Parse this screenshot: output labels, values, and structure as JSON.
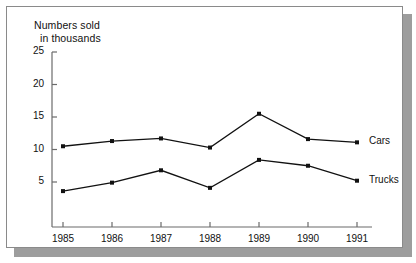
{
  "figure": {
    "axis_title_line1": "Numbers sold",
    "axis_title_line2": "in thousands",
    "border_color": "#8a8a8a",
    "shadow_color": "#9d9d9d",
    "ink_color": "#111111"
  },
  "chart_data": {
    "type": "line",
    "title": "",
    "subtitle": "",
    "xlabel": "",
    "ylabel": "Numbers sold in thousands",
    "categories": [
      "1985",
      "1986",
      "1987",
      "1988",
      "1989",
      "1990",
      "1991"
    ],
    "x": [
      1985,
      1986,
      1987,
      1988,
      1989,
      1990,
      1991
    ],
    "ylim": [
      0,
      25
    ],
    "yticks": [
      5,
      10,
      15,
      20,
      25
    ],
    "ytick_labels": [
      "5",
      "10",
      "15",
      "20",
      "25"
    ],
    "grid": false,
    "legend_position": "right-of-line-end",
    "markers": "filled-square",
    "series": [
      {
        "name": "Cars",
        "label": "Cars",
        "color": "#111111",
        "values": [
          10.5,
          11.3,
          11.7,
          10.3,
          15.5,
          11.6,
          11.1
        ]
      },
      {
        "name": "Trucks",
        "label": "Trucks",
        "color": "#111111",
        "values": [
          3.6,
          4.9,
          6.8,
          4.1,
          8.4,
          7.5,
          5.2
        ]
      }
    ]
  }
}
